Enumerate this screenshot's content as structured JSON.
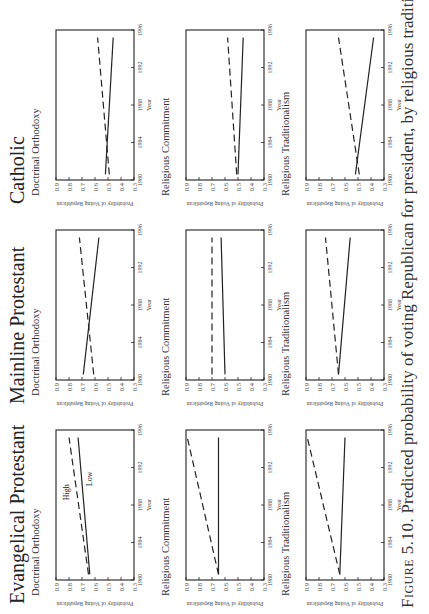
{
  "caption": {
    "figure_label": "Figure 5.10.",
    "text": "Predicted probability of voting Republican for president, by religious tradition, doctrinal"
  },
  "axes": {
    "ylabel": "Probability of Voting Republican",
    "xlabel": "Year",
    "y_ticks": [
      "0.9",
      "0.8",
      "0.7",
      "0.6",
      "0.5",
      "0.4",
      "0.3"
    ],
    "x_ticks": [
      "1980",
      "1984",
      "1988",
      "1992",
      "1996"
    ]
  },
  "columns": [
    {
      "title": "Evangelical Protestant"
    },
    {
      "title": "Mainline Protestant"
    },
    {
      "title": "Catholic"
    }
  ],
  "line_labels": {
    "high": "High",
    "low": "Low"
  },
  "chart_data": [
    {
      "type": "line",
      "tradition": "Evangelical Protestant",
      "title": "Doctrinal Orthodoxy",
      "xlabel": "Year",
      "ylabel": "Probability of Voting Republican",
      "x": [
        1980,
        1996
      ],
      "ylim": [
        0.3,
        0.9
      ],
      "xlim": [
        1980,
        1996
      ],
      "annotations": [
        "High",
        "Low"
      ],
      "series": [
        {
          "name": "High",
          "style": "dashed",
          "values": [
            0.65,
            0.8
          ]
        },
        {
          "name": "Low",
          "style": "solid",
          "values": [
            0.64,
            0.73
          ]
        }
      ]
    },
    {
      "type": "line",
      "tradition": "Evangelical Protestant",
      "title": "Religious Commitment",
      "xlabel": "Year",
      "ylabel": "Probability of Voting Republican",
      "x": [
        1980,
        1996
      ],
      "ylim": [
        0.3,
        0.9
      ],
      "xlim": [
        1980,
        1996
      ],
      "series": [
        {
          "name": "High",
          "style": "dashed",
          "values": [
            0.65,
            0.89
          ]
        },
        {
          "name": "Low",
          "style": "solid",
          "values": [
            0.65,
            0.65
          ]
        }
      ]
    },
    {
      "type": "line",
      "tradition": "Evangelical Protestant",
      "title": "Religious Traditionalism",
      "xlabel": "Year",
      "ylabel": "Probability of Voting Republican",
      "x": [
        1980,
        1996
      ],
      "ylim": [
        0.3,
        0.9
      ],
      "xlim": [
        1980,
        1996
      ],
      "series": [
        {
          "name": "High",
          "style": "dashed",
          "values": [
            0.64,
            0.89
          ]
        },
        {
          "name": "Low",
          "style": "solid",
          "values": [
            0.64,
            0.6
          ]
        }
      ]
    },
    {
      "type": "line",
      "tradition": "Mainline Protestant",
      "title": "Doctrinal Orthodoxy",
      "xlabel": "Year",
      "ylabel": "Probability of Voting Republican",
      "x": [
        1980,
        1996
      ],
      "ylim": [
        0.3,
        0.9
      ],
      "xlim": [
        1980,
        1996
      ],
      "series": [
        {
          "name": "High",
          "style": "dashed",
          "values": [
            0.61,
            0.72
          ]
        },
        {
          "name": "Low",
          "style": "solid",
          "values": [
            0.69,
            0.57
          ]
        }
      ]
    },
    {
      "type": "line",
      "tradition": "Mainline Protestant",
      "title": "Religious Commitment",
      "xlabel": "Year",
      "ylabel": "Probability of Voting Republican",
      "x": [
        1980,
        1996
      ],
      "ylim": [
        0.3,
        0.9
      ],
      "xlim": [
        1980,
        1996
      ],
      "series": [
        {
          "name": "High",
          "style": "dashed",
          "values": [
            0.7,
            0.7
          ]
        },
        {
          "name": "Low",
          "style": "solid",
          "values": [
            0.6,
            0.63
          ]
        }
      ]
    },
    {
      "type": "line",
      "tradition": "Mainline Protestant",
      "title": "Religious Traditionalism",
      "xlabel": "Year",
      "ylabel": "Probability of Voting Republican",
      "x": [
        1980,
        1996
      ],
      "ylim": [
        0.3,
        0.9
      ],
      "xlim": [
        1980,
        1996
      ],
      "series": [
        {
          "name": "High",
          "style": "dashed",
          "values": [
            0.65,
            0.75
          ]
        },
        {
          "name": "Low",
          "style": "solid",
          "values": [
            0.65,
            0.56
          ]
        }
      ]
    },
    {
      "type": "line",
      "tradition": "Catholic",
      "title": "Doctrinal Orthodoxy",
      "xlabel": "Year",
      "ylabel": "Probability of Voting Republican",
      "x": [
        1980,
        1996
      ],
      "ylim": [
        0.3,
        0.9
      ],
      "xlim": [
        1980,
        1996
      ],
      "series": [
        {
          "name": "High",
          "style": "dashed",
          "values": [
            0.49,
            0.58
          ]
        },
        {
          "name": "Low",
          "style": "solid",
          "values": [
            0.52,
            0.46
          ]
        }
      ]
    },
    {
      "type": "line",
      "tradition": "Catholic",
      "title": "Religious Commitment",
      "xlabel": "Year",
      "ylabel": "Probability of Voting Republican",
      "x": [
        1980,
        1996
      ],
      "ylim": [
        0.3,
        0.9
      ],
      "xlim": [
        1980,
        1996
      ],
      "series": [
        {
          "name": "High",
          "style": "dashed",
          "values": [
            0.51,
            0.58
          ]
        },
        {
          "name": "Low",
          "style": "solid",
          "values": [
            0.5,
            0.46
          ]
        }
      ]
    },
    {
      "type": "line",
      "tradition": "Catholic",
      "title": "Religious Traditionalism",
      "xlabel": "Year",
      "ylabel": "Probability of Voting Republican",
      "x": [
        1980,
        1996
      ],
      "ylim": [
        0.3,
        0.9
      ],
      "xlim": [
        1980,
        1996
      ],
      "series": [
        {
          "name": "High",
          "style": "dashed",
          "values": [
            0.49,
            0.65
          ]
        },
        {
          "name": "Low",
          "style": "solid",
          "values": [
            0.52,
            0.38
          ]
        }
      ]
    }
  ]
}
